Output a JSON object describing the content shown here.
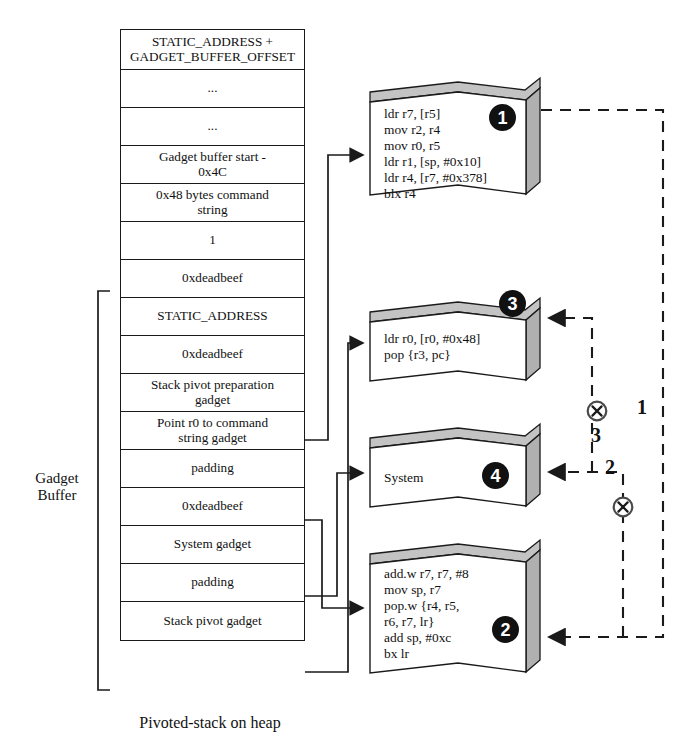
{
  "caption": "Pivoted-stack on heap",
  "buffer_bracket_label": "Gadget\nBuffer",
  "stack": {
    "name": "pivoted-stack",
    "cells": [
      {
        "id": "static-address-offset",
        "text": "STATIC_ADDRESS +\nGADGET_BUFFER_OFFSET",
        "height": 40
      },
      {
        "id": "ellipsis-1",
        "text": "...",
        "height": 38
      },
      {
        "id": "ellipsis-2",
        "text": "...",
        "height": 38
      },
      {
        "id": "gadget-buffer-start",
        "text": "Gadget buffer start -\n0x4C",
        "height": 38
      },
      {
        "id": "command-string",
        "text": "0x48 bytes command\nstring",
        "height": 38
      },
      {
        "id": "one",
        "text": "1",
        "height": 38
      },
      {
        "id": "deadbeef-1",
        "text": "0xdeadbeef",
        "height": 38
      },
      {
        "id": "static-address",
        "text": "STATIC_ADDRESS",
        "height": 38
      },
      {
        "id": "deadbeef-2",
        "text": "0xdeadbeef",
        "height": 38
      },
      {
        "id": "stack-pivot-prep-gadget",
        "text": "Stack pivot preparation\ngadget",
        "height": 38
      },
      {
        "id": "point-r0-gadget",
        "text": "Point r0 to command\nstring gadget",
        "height": 38
      },
      {
        "id": "padding-1",
        "text": "padding",
        "height": 38
      },
      {
        "id": "deadbeef-3",
        "text": "0xdeadbeef",
        "height": 38
      },
      {
        "id": "system-gadget",
        "text": "System gadget",
        "height": 38
      },
      {
        "id": "padding-2",
        "text": "padding",
        "height": 38
      },
      {
        "id": "stack-pivot-gadget",
        "text": "Stack pivot gadget",
        "height": 38
      }
    ]
  },
  "gadgets": [
    {
      "id": "gadget-1",
      "badge": "1",
      "code": "ldr r7, [r5]\nmov r2, r4\nmov r0, r5\nldr r1, [sp, #0x10]\nldr r4, [r7, #0x378]\nblx r4"
    },
    {
      "id": "gadget-3",
      "badge": "3",
      "code": "ldr r0, [r0, #0x48]\npop {r3, pc}"
    },
    {
      "id": "gadget-4",
      "badge": "4",
      "code": "System"
    },
    {
      "id": "gadget-2",
      "badge": "2",
      "code": "add.w r7, r7, #8\nmov sp, r7\npop.w {r4, r5,\nr6, r7, lr}\nadd sp, #0xc\nbx lr"
    }
  ],
  "flow_labels": [
    {
      "id": "flow-1",
      "text": "1"
    },
    {
      "id": "flow-2",
      "text": "2"
    },
    {
      "id": "flow-3",
      "text": "3"
    }
  ],
  "colors": {
    "ink": "#111111",
    "box_face": "#ffffff",
    "box_shade": "#b5b5b5",
    "badge_bg": "#111111"
  }
}
